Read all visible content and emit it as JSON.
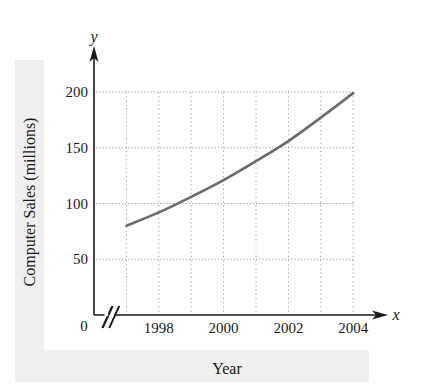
{
  "chart_data": {
    "type": "line",
    "title": "",
    "xlabel": "Year",
    "ylabel": "Computer Sales (millions)",
    "x_axis_symbol": "x",
    "y_axis_symbol": "y",
    "origin_label": "0",
    "x_ticks": [
      "1998",
      "2000",
      "2002",
      "2004"
    ],
    "y_ticks": [
      "50",
      "100",
      "150",
      "200"
    ],
    "xlim": [
      1996,
      2004
    ],
    "ylim": [
      0,
      200
    ],
    "axis_break_on_x": true,
    "grid": "dotted",
    "x": [
      1997,
      1998,
      1999,
      2000,
      2001,
      2002,
      2003,
      2004
    ],
    "series": [
      {
        "name": "Computer Sales",
        "values": [
          80,
          92,
          106,
          121,
          138,
          156,
          177,
          199
        ]
      }
    ],
    "colors": {
      "line": "#6b6b6b",
      "axis": "#1a1a1a",
      "grid": "#9a9a9a",
      "label_band": "#efefef"
    }
  }
}
